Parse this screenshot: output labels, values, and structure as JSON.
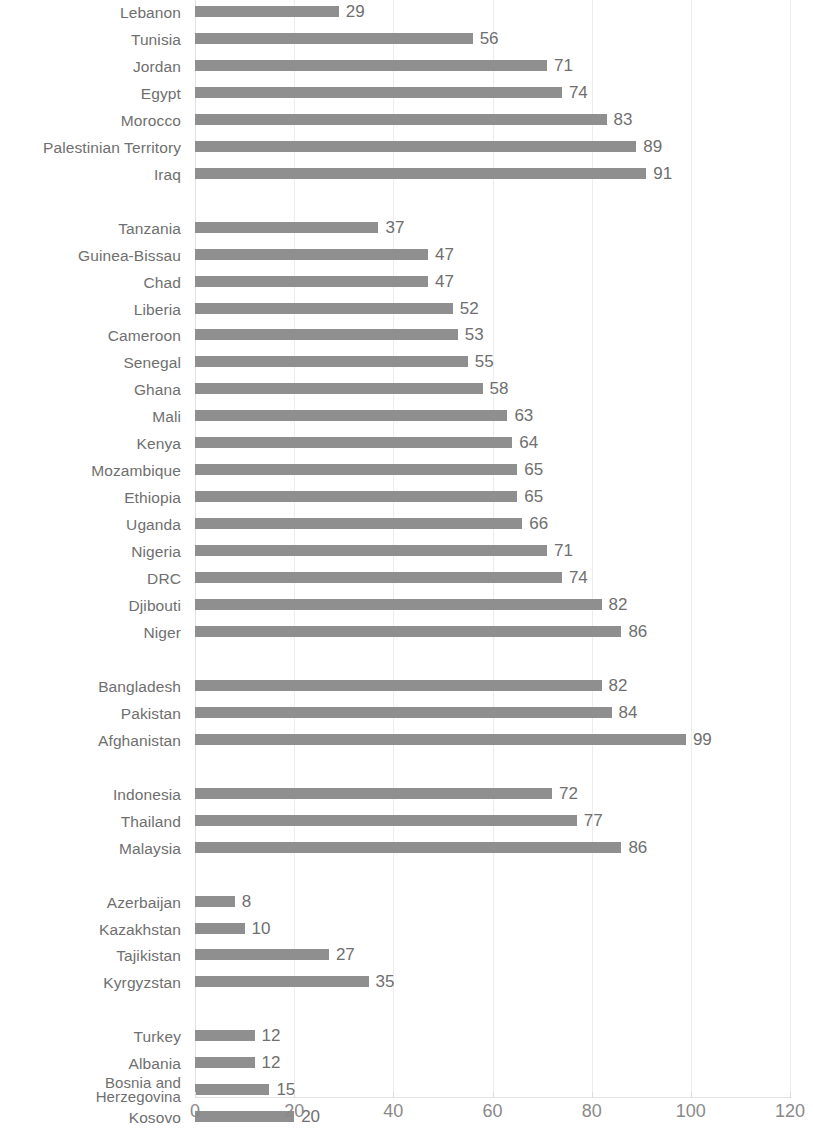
{
  "chart_data": {
    "type": "bar",
    "orientation": "horizontal",
    "title": "",
    "xlabel": "",
    "ylabel": "",
    "xlim": [
      0,
      120
    ],
    "xticks": [
      0,
      20,
      40,
      60,
      80,
      100,
      120
    ],
    "xtick_labels": [
      "0",
      "20",
      "40",
      "60",
      "80",
      "100",
      "120"
    ],
    "grid": "vertical",
    "legend": "none",
    "bar_color": "#8f8f8f",
    "label_color": "#6f6f6f",
    "groups": [
      {
        "name": "group-1",
        "categories": [
          "Lebanon",
          "Tunisia",
          "Jordan",
          "Egypt",
          "Morocco",
          "Palestinian Territory",
          "Iraq"
        ],
        "values": [
          29,
          56,
          71,
          74,
          83,
          89,
          91
        ]
      },
      {
        "name": "group-2",
        "categories": [
          "Tanzania",
          "Guinea-Bissau",
          "Chad",
          "Liberia",
          "Cameroon",
          "Senegal",
          "Ghana",
          "Mali",
          "Kenya",
          "Mozambique",
          "Ethiopia",
          "Uganda",
          "Nigeria",
          "DRC",
          "Djibouti",
          "Niger"
        ],
        "values": [
          37,
          47,
          47,
          52,
          53,
          55,
          58,
          63,
          64,
          65,
          65,
          66,
          71,
          74,
          82,
          86
        ]
      },
      {
        "name": "group-3",
        "categories": [
          "Bangladesh",
          "Pakistan",
          "Afghanistan"
        ],
        "values": [
          82,
          84,
          99
        ]
      },
      {
        "name": "group-4",
        "categories": [
          "Indonesia",
          "Thailand",
          "Malaysia"
        ],
        "values": [
          72,
          77,
          86
        ]
      },
      {
        "name": "group-5",
        "categories": [
          "Azerbaijan",
          "Kazakhstan",
          "Tajikistan",
          "Kyrgyzstan"
        ],
        "values": [
          8,
          10,
          27,
          35
        ]
      },
      {
        "name": "group-6",
        "categories": [
          "Turkey",
          "Albania",
          "Bosnia and Herzegovina",
          "Kosovo"
        ],
        "values": [
          12,
          12,
          15,
          20
        ]
      }
    ]
  }
}
